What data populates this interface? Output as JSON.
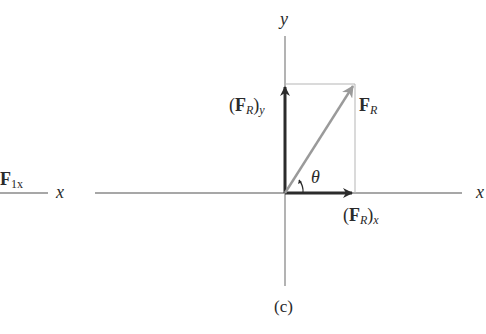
{
  "figure": {
    "caption": "(c)",
    "axes": {
      "x_label": "x",
      "y_label": "y",
      "left_partial_x_label": "x"
    },
    "left_fragment": {
      "label_main": "F",
      "label_sub": "1x"
    },
    "vectors": {
      "resultant": {
        "label_main": "F",
        "label_sub": "R",
        "color": "#9a9a9a"
      },
      "x_component": {
        "label_open": "(",
        "label_main": "F",
        "label_sub": "R",
        "label_close": ")",
        "label_sub2": "x",
        "color": "#2b2b2b"
      },
      "y_component": {
        "label_open": "(",
        "label_main": "F",
        "label_sub": "R",
        "label_close": ")",
        "label_sub2": "y",
        "color": "#2b2b2b"
      }
    },
    "angle": {
      "symbol": "θ"
    },
    "colors": {
      "axis": "#8a8a8a",
      "guide": "#b5b5b5",
      "text": "#2a2a2a"
    }
  }
}
